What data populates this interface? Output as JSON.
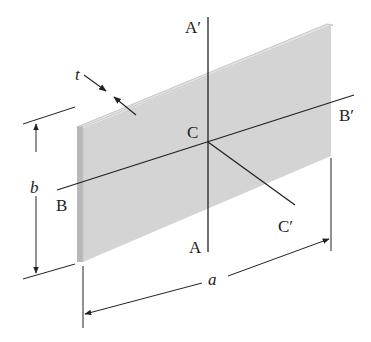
{
  "diagram": {
    "type": "thin rectangular plate with centroidal axes",
    "colors": {
      "plate_face": "#d4d4d4",
      "plate_edge": "#b8b8b8",
      "plate_edge_highlight": "#e6e6e6",
      "line": "#222222",
      "background": "#ffffff"
    },
    "labels": {
      "thickness": "t",
      "height": "b",
      "width": "a",
      "centroid": "C",
      "axis_a_bottom": "A",
      "axis_a_top": "A′",
      "axis_b_left": "B",
      "axis_b_right": "B′",
      "axis_c_end": "C′"
    },
    "dimensions": {
      "thickness_symbol": "t",
      "height_symbol": "b",
      "width_symbol": "a"
    }
  }
}
